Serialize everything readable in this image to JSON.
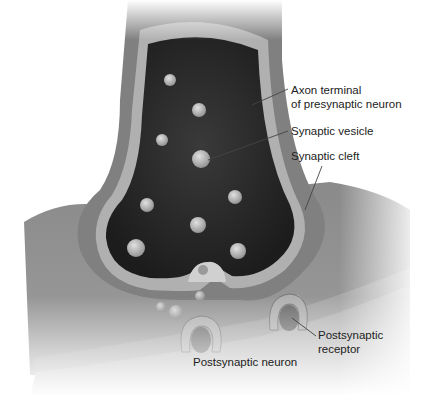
{
  "diagram": {
    "type": "synapse-illustration",
    "labels": {
      "axon_terminal_line1": "Axon terminal",
      "axon_terminal_line2": "of presynaptic neuron",
      "synaptic_vesicle": "Synaptic vesicle",
      "synaptic_cleft": "Synaptic cleft",
      "postsynaptic_receptor_line1": "Postsynaptic",
      "postsynaptic_receptor_line2": "receptor",
      "postsynaptic_neuron": "Postsynaptic neuron"
    },
    "colors": {
      "background": "#ffffff",
      "cytoplasm_dark": "#2a2a2a",
      "membrane_light": "#a8a8a8",
      "outer_wall": "#7a7a7a",
      "postsynaptic_body": "#8c8c8c",
      "vesicle": "#b8b8b8",
      "label_text": "#222222",
      "leader_line": "#444444"
    }
  }
}
